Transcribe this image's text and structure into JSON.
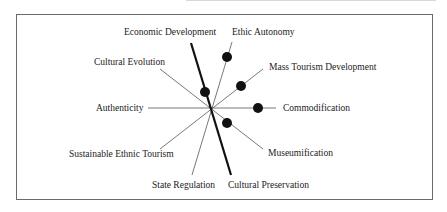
{
  "diagram": {
    "center": {
      "x": 211,
      "y": 108
    },
    "axes": [
      {
        "label": "Economic Development",
        "end": [
          191,
          43
        ],
        "thick": true,
        "opposite_label": "Cultural Preservation",
        "opposite_end": [
          231,
          175
        ]
      },
      {
        "label": "Ethic Autonomy",
        "end": [
          232,
          42
        ],
        "opposite_label": "State Regulation",
        "opposite_end": [
          192,
          175
        ]
      },
      {
        "label": "Mass Tourism Development",
        "end": [
          263,
          69
        ],
        "opposite_label": "Sustainable Ethnic Tourism",
        "opposite_end": [
          160,
          149
        ]
      },
      {
        "label": "Commodification",
        "end": [
          276,
          108
        ],
        "opposite_label": "Authenticity",
        "opposite_end": [
          148,
          108
        ]
      },
      {
        "label": "Museumification",
        "end": [
          263,
          149
        ],
        "opposite_label": "Cultural Evolution",
        "opposite_end": [
          160,
          69
        ]
      }
    ],
    "points": [
      {
        "axis": "Ethic Autonomy",
        "x": 227,
        "y": 57
      },
      {
        "axis": "Mass Tourism Development",
        "x": 241,
        "y": 86
      },
      {
        "axis": "Economic Development",
        "x": 205,
        "y": 92
      },
      {
        "axis": "Commodification",
        "x": 258,
        "y": 108
      },
      {
        "axis": "Museumification",
        "x": 227,
        "y": 123
      }
    ],
    "labels": {
      "economic_development": "Economic Development",
      "ethic_autonomy": "Ethic Autonomy",
      "cultural_evolution": "Cultural Evolution",
      "mass_tourism_development": "Mass Tourism Development",
      "authenticity": "Authenticity",
      "commodification": "Commodification",
      "sustainable_ethnic_tourism": "Sustainable Ethnic Tourism",
      "museumification": "Museumification",
      "state_regulation": "State Regulation",
      "cultural_preservation": "Cultural Preservation"
    },
    "colors": {
      "line": "#555555",
      "thick_line": "#111111",
      "dot": "#111111",
      "frame": "#6a6a6a"
    }
  }
}
